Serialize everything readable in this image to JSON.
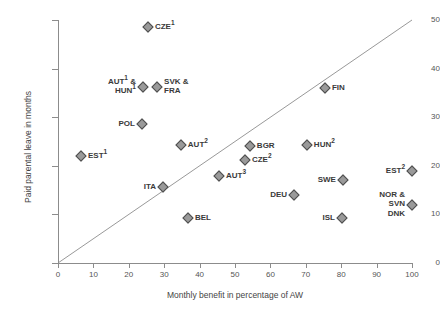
{
  "chart_data": {
    "type": "scatter",
    "title": "",
    "xlabel": "Monthly benefit in percentage of AW",
    "ylabel": "Paid parental leave in months",
    "xlim": [
      0,
      100
    ],
    "ylim": [
      0,
      50
    ],
    "xticks": [
      0,
      10,
      20,
      30,
      40,
      50,
      60,
      70,
      80,
      90,
      100
    ],
    "yticks": [
      0,
      10,
      20,
      30,
      40,
      50
    ],
    "grid": false,
    "legend": "none",
    "marker_color": "#9a9a9a",
    "marker_edge_color": "#4d4d4d",
    "reference_line": {
      "description": "diagonal line from origin",
      "from": [
        0,
        0
      ],
      "to": [
        100,
        50
      ],
      "color": "#999999"
    },
    "points": [
      {
        "label": "CZE",
        "sup": "1",
        "x": 25.4,
        "y": 48.5,
        "side": "right"
      },
      {
        "label": "AUT",
        "sup": "1",
        "label2": "HUN",
        "sup2": "1",
        "x": 24.0,
        "y": 36.3,
        "side": "left-stack"
      },
      {
        "label": "SVK &",
        "label2": "FRA",
        "x": 28.0,
        "y": 36.3,
        "side": "right-stack"
      },
      {
        "label": "POL",
        "x": 23.7,
        "y": 28.6,
        "side": "left"
      },
      {
        "label": "EST",
        "sup": "1",
        "x": 6.5,
        "y": 22.0,
        "side": "right"
      },
      {
        "label": "AUT",
        "sup": "2",
        "x": 34.7,
        "y": 24.3,
        "side": "right"
      },
      {
        "label": "BGR",
        "x": 54.2,
        "y": 24.1,
        "side": "right"
      },
      {
        "label": "HUN",
        "sup": "2",
        "x": 70.3,
        "y": 24.3,
        "side": "right"
      },
      {
        "label": "CZE",
        "sup": "2",
        "x": 52.8,
        "y": 21.2,
        "side": "right"
      },
      {
        "label": "FIN",
        "x": 75.4,
        "y": 36.1,
        "side": "right"
      },
      {
        "label": "EST",
        "sup": "2",
        "x": 100.0,
        "y": 18.9,
        "side": "left"
      },
      {
        "label": "ITA",
        "x": 29.7,
        "y": 15.6,
        "side": "left"
      },
      {
        "label": "AUT",
        "sup": "3",
        "x": 45.5,
        "y": 17.8,
        "side": "right"
      },
      {
        "label": "SWE",
        "x": 80.5,
        "y": 17.0,
        "side": "left"
      },
      {
        "label": "DEU",
        "x": 66.7,
        "y": 13.9,
        "side": "left"
      },
      {
        "label": "BEL",
        "x": 36.7,
        "y": 9.3,
        "side": "right"
      },
      {
        "label": "ISL",
        "x": 80.2,
        "y": 9.3,
        "side": "left"
      },
      {
        "label": "NOR &",
        "label2": "SVN",
        "label3": "DNK",
        "x": 100.0,
        "y": 12.0,
        "side": "left-triple"
      }
    ]
  },
  "axes": {
    "x_title": "Monthly benefit in percentage of AW",
    "y_title": "Paid parental leave in months",
    "x_tick_labels": [
      "0",
      "10",
      "20",
      "30",
      "40",
      "50",
      "60",
      "70",
      "80",
      "90",
      "100"
    ],
    "y_tick_labels": [
      "0",
      "10",
      "20",
      "30",
      "40",
      "50"
    ]
  }
}
